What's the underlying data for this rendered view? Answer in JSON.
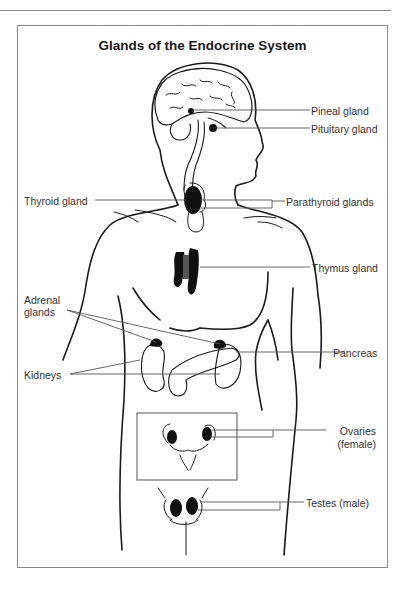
{
  "diagram": {
    "title": "Glands of the Endocrine System",
    "colors": {
      "line": "#1a1a1a",
      "leader": "#555555",
      "gland": "#111111",
      "thymus_center": "#555555",
      "frame": "#8a8a8a"
    },
    "labels": {
      "pineal": "Pineal gland",
      "pituitary": "Pituitary gland",
      "thyroid": "Thyroid gland",
      "parathyroid": "Parathyroid glands",
      "thymus": "Thymus gland",
      "adrenal_line1": "Adrenal",
      "adrenal_line2": "glands",
      "pancreas": "Pancreas",
      "kidneys": "Kidneys",
      "ovaries_line1": "Ovaries",
      "ovaries_line2": "(female)",
      "testes": "Testes (male)"
    }
  }
}
